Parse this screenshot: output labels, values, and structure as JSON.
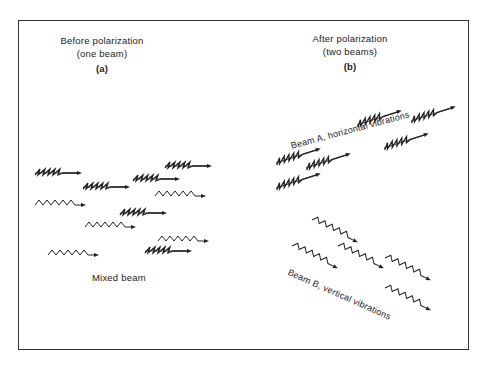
{
  "panels": {
    "a": {
      "title_line1": "Before polarization",
      "title_line2": "(one beam)",
      "tag": "(a)",
      "beam_label": "Mixed beam",
      "rays": [
        {
          "kind": "edge-on",
          "x": 35,
          "y": 173
        },
        {
          "kind": "edge-on",
          "x": 83,
          "y": 187
        },
        {
          "kind": "edge-on",
          "x": 133,
          "y": 179
        },
        {
          "kind": "edge-on",
          "x": 165,
          "y": 166
        },
        {
          "kind": "wave",
          "x": 35,
          "y": 205
        },
        {
          "kind": "wave",
          "x": 155,
          "y": 196
        },
        {
          "kind": "edge-on",
          "x": 120,
          "y": 213
        },
        {
          "kind": "wave",
          "x": 85,
          "y": 227
        },
        {
          "kind": "wave",
          "x": 158,
          "y": 241
        },
        {
          "kind": "edge-on",
          "x": 145,
          "y": 251
        },
        {
          "kind": "wave",
          "x": 48,
          "y": 255
        }
      ]
    },
    "b": {
      "title_line1": "After polarization",
      "title_line2": "(two beams)",
      "tag": "(b)",
      "beam_a_label": "Beam A, horizontal  vibrations",
      "beam_b_label": "Beam B,  vertical vibrations",
      "beam_a_rays": [
        {
          "x": 276,
          "y": 163
        },
        {
          "x": 306,
          "y": 168
        },
        {
          "x": 357,
          "y": 125
        },
        {
          "x": 411,
          "y": 121
        },
        {
          "x": 384,
          "y": 148
        },
        {
          "x": 276,
          "y": 188
        }
      ],
      "beam_b_rays": [
        {
          "x": 312,
          "y": 220
        },
        {
          "x": 292,
          "y": 246
        },
        {
          "x": 338,
          "y": 246
        },
        {
          "x": 385,
          "y": 258
        },
        {
          "x": 385,
          "y": 288
        }
      ]
    }
  }
}
